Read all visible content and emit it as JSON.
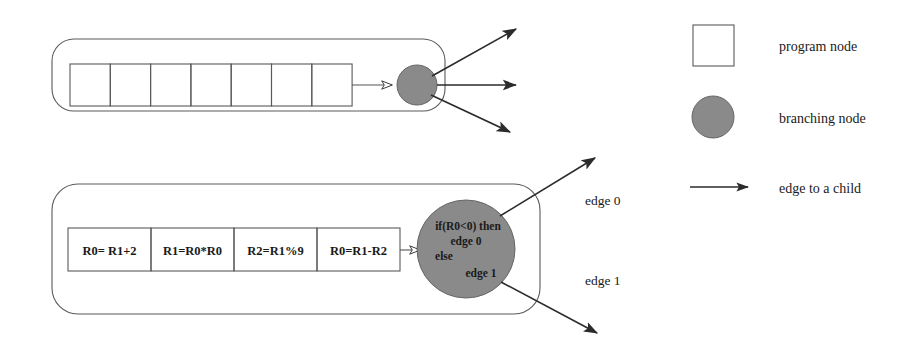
{
  "figure": {
    "colors": {
      "branching_node_fill": "#8a8a8a",
      "outline": "#5a5a5a",
      "arrow": "#2b2b2b",
      "text": "#1a1a1a",
      "background": "#ffffff"
    }
  },
  "top_diagram": {
    "name": "generic-program-node",
    "instruction_cells": [
      "",
      "",
      "",
      "",
      "",
      "",
      ""
    ],
    "branching_node_label": "",
    "outgoing_edges": 3
  },
  "bottom_diagram": {
    "name": "concrete-program-node",
    "instructions": [
      "R0= R1+2",
      "R1=R0*R0",
      "R2=R1%9",
      "R0=R1-R2"
    ],
    "branching_node": {
      "line1": "if(R0<0) then",
      "line2": "edge 0",
      "line3": "else",
      "line4": "edge 1"
    },
    "edge_labels": {
      "edge0": "edge 0",
      "edge1": "edge 1"
    }
  },
  "legend": {
    "items": [
      {
        "icon": "square-outline-icon",
        "label": "program node"
      },
      {
        "icon": "filled-circle-icon",
        "label": "branching node"
      },
      {
        "icon": "arrow-right-icon",
        "label": "edge to a child"
      }
    ]
  }
}
